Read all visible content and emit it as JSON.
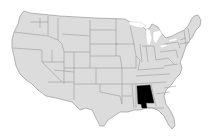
{
  "map": {
    "title": "United States",
    "type": "choropleth-highlight",
    "base_fill": "#dcdcdc",
    "border_color": "#8f8f8f",
    "background": "#ffffff",
    "highlighted_state": {
      "name": "Alabama",
      "fill": "#000000"
    }
  }
}
